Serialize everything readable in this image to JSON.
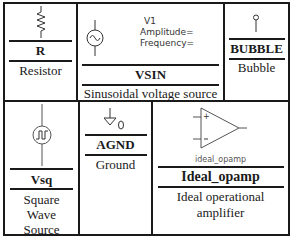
{
  "components": [
    {
      "name": "R",
      "description": "Resistor",
      "icon": "resistor-icon"
    },
    {
      "name": "VSIN",
      "description": "Sinusoidal voltage source",
      "icon": "sine-source-icon",
      "labels": {
        "ref": "V1",
        "amplitude": "Amplitude=",
        "frequency": "Frequency="
      }
    },
    {
      "name": "BUBBLE",
      "description": "Bubble",
      "icon": "bubble-icon"
    },
    {
      "name": "Vsq",
      "description_lines": [
        "Square",
        "Wave",
        "Source"
      ],
      "icon": "square-wave-source-icon"
    },
    {
      "name": "AGND",
      "description": "Ground",
      "icon": "ground-icon",
      "labels": {
        "node": "0"
      }
    },
    {
      "name": "Ideal_opamp",
      "description_lines": [
        "Ideal operational",
        "amplifier"
      ],
      "icon": "opamp-icon",
      "labels": {
        "part": "ideal_opamp",
        "plus": "+",
        "minus": "−"
      }
    }
  ]
}
